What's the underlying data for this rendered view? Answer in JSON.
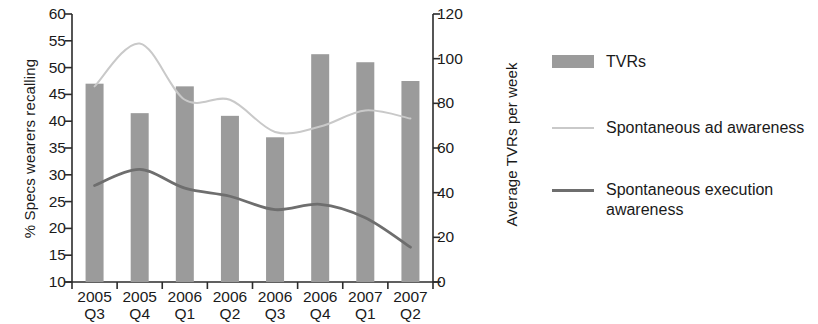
{
  "chart_data": {
    "type": "bar",
    "title": "",
    "subtitle": "",
    "xlabel": "",
    "ylabel": "% Specs wearers recalling",
    "y2label": "Average TVRs per week",
    "categories": [
      "2005\nQ3",
      "2005\nQ4",
      "2006\nQ1",
      "2006\nQ2",
      "2006\nQ3",
      "2006\nQ4",
      "2007\nQ1",
      "2007\nQ2"
    ],
    "category_lines": [
      [
        "2005",
        "Q3"
      ],
      [
        "2005",
        "Q4"
      ],
      [
        "2006",
        "Q1"
      ],
      [
        "2006",
        "Q2"
      ],
      [
        "2006",
        "Q3"
      ],
      [
        "2006",
        "Q4"
      ],
      [
        "2007",
        "Q1"
      ],
      [
        "2007",
        "Q2"
      ]
    ],
    "ylim": [
      10,
      60
    ],
    "yticks": [
      10,
      15,
      20,
      25,
      30,
      35,
      40,
      45,
      50,
      55,
      60
    ],
    "ytick_labels": [
      "10",
      "15",
      "20",
      "25",
      "30",
      "35",
      "40",
      "45",
      "50",
      "55",
      "60"
    ],
    "y2lim": [
      0,
      120
    ],
    "y2ticks": [
      0,
      20,
      40,
      60,
      80,
      100,
      120
    ],
    "y2tick_labels": [
      "0",
      "20",
      "40",
      "60",
      "80",
      "100",
      "120"
    ],
    "grid": false,
    "legend_position": "right",
    "series": [
      {
        "name": "TVRs",
        "type": "bar",
        "axis": "right",
        "color": "#9b9b9b",
        "values_right_axis": [
          89,
          75,
          87,
          74,
          65,
          102,
          98,
          90
        ],
        "values": [
          47.0,
          41.5,
          46.5,
          41.0,
          37.0,
          52.5,
          51.0,
          47.5
        ]
      },
      {
        "name": "Spontaneous ad awareness",
        "type": "line",
        "axis": "left",
        "color": "#c9c9c9",
        "values": [
          46.5,
          54.5,
          44.0,
          44.0,
          38.0,
          39.0,
          42.0,
          40.5
        ]
      },
      {
        "name": "Spontaneous execution awareness",
        "type": "line",
        "axis": "left",
        "color": "#6e6e6e",
        "values": [
          28.0,
          31.0,
          27.5,
          26.0,
          23.5,
          24.5,
          22.0,
          16.5
        ]
      }
    ]
  },
  "legend": {
    "items": [
      {
        "label": "TVRs",
        "key": "bar",
        "color": "#9b9b9b"
      },
      {
        "label": "Spontaneous ad awareness",
        "key": "line-light",
        "color": "#c9c9c9"
      },
      {
        "label": "Spontaneous execution awareness",
        "key": "line-dark",
        "color": "#6e6e6e"
      }
    ]
  }
}
